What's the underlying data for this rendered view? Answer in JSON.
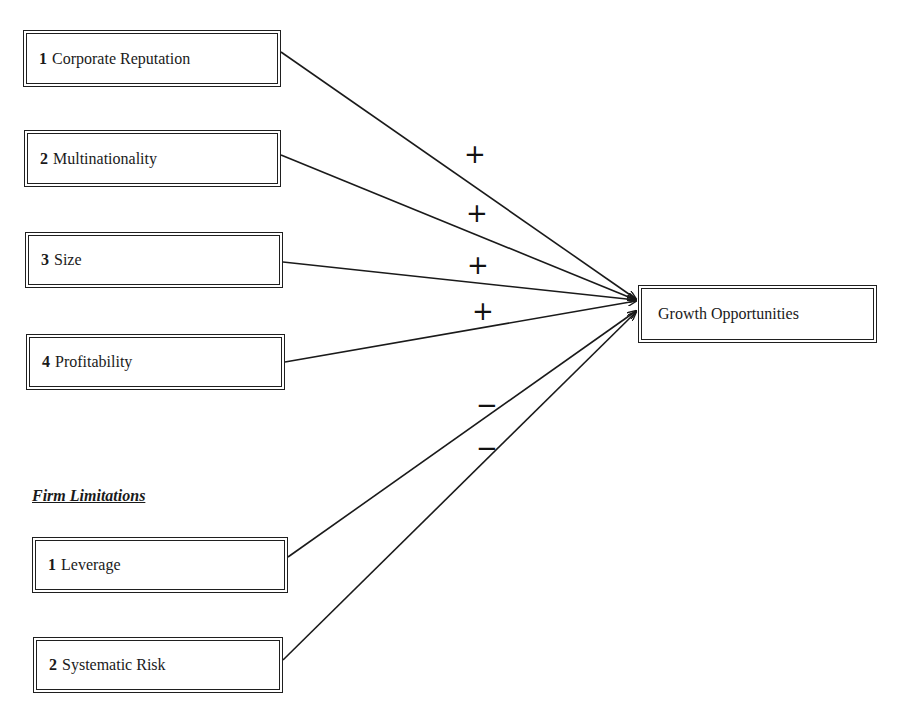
{
  "drivers": [
    {
      "num": "1",
      "label": "Corporate Reputation",
      "sign": "+"
    },
    {
      "num": "2",
      "label": "Multinationality",
      "sign": "+"
    },
    {
      "num": "3",
      "label": "Size",
      "sign": "+"
    },
    {
      "num": "4",
      "label": "Profitability",
      "sign": "+"
    }
  ],
  "limitations": {
    "heading": "Firm Limitations",
    "items": [
      {
        "num": "1",
        "label": "Leverage",
        "sign": "−"
      },
      {
        "num": "2",
        "label": "Systematic Risk",
        "sign": "−"
      }
    ]
  },
  "outcome": {
    "label": "Growth Opportunities"
  }
}
